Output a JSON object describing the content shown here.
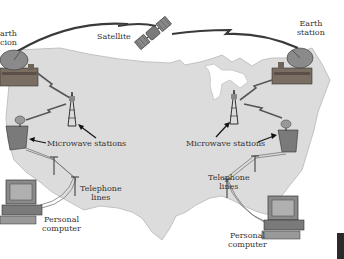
{
  "diagram": {
    "labels": {
      "earth_station_left_line1": "arth",
      "earth_station_left_line2": "cion",
      "satellite": "Satellite",
      "earth_station_right_line1": "Earth",
      "earth_station_right_line2": "station",
      "microwave_left": "Microwave stations",
      "microwave_right": "Microwave stations",
      "telephone_left_line1": "Telephone",
      "telephone_left_line2": "lines",
      "telephone_right_line1": "Telephone",
      "telephone_right_line2": "lines",
      "pc_left_line1": "Personal",
      "pc_left_line2": "computer",
      "pc_right_line1": "Personal",
      "pc_right_line2": "computer"
    },
    "colors": {
      "map_fill": "#d9d9d9",
      "map_stroke": "#bdbdbd",
      "background": "#ffffff",
      "link_arc": "#3a3a3a",
      "equipment": "#6e6e6e",
      "text": "#333333"
    }
  }
}
